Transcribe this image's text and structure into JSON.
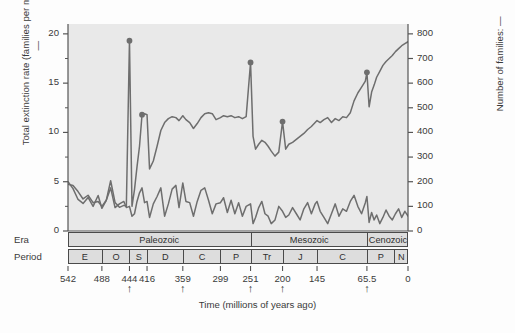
{
  "chart_data": {
    "type": "line",
    "title": "",
    "xlabel": "Time (millions of years ago)",
    "ylabel_left": "Total extinction rate (families per million years): —",
    "ylabel_right": "Number of families: —",
    "xlim": [
      542,
      0
    ],
    "x_reversed": true,
    "xticks": [
      "542",
      "488",
      "444",
      "416",
      "359",
      "299",
      "251",
      "200",
      "145",
      "65.5",
      "0"
    ],
    "xtick_values": [
      542,
      488,
      444,
      416,
      359,
      299,
      251,
      200,
      145,
      65.5,
      0
    ],
    "ylim_left": [
      0,
      21
    ],
    "yticks_left": [
      "0",
      "5",
      "10",
      "15",
      "20"
    ],
    "ytick_values_left": [
      0,
      5,
      10,
      15,
      20
    ],
    "ylim_right": [
      0,
      840
    ],
    "yticks_right": [
      "0",
      "100",
      "200",
      "300",
      "400",
      "500",
      "600",
      "700",
      "800"
    ],
    "ytick_values_right": [
      0,
      100,
      200,
      300,
      400,
      500,
      600,
      700,
      800
    ],
    "grid": false,
    "legend": "none",
    "mass_extinction_arrows": [
      444,
      359,
      251,
      200,
      65.5
    ],
    "series": [
      {
        "name": "Total extinction rate (families per million years)",
        "axis": "left",
        "color": "#6e6e6e",
        "x": [
          542,
          534,
          526,
          518,
          510,
          502,
          494,
          488,
          481,
          474,
          467,
          460,
          453,
          449,
          444,
          440,
          436,
          432,
          428,
          424,
          420,
          416,
          412,
          406,
          400,
          394,
          388,
          382,
          376,
          370,
          365,
          359,
          354,
          348,
          342,
          336,
          330,
          324,
          318,
          312,
          306,
          299,
          294,
          288,
          282,
          276,
          270,
          264,
          258,
          251,
          247,
          243,
          238,
          233,
          228,
          223,
          218,
          212,
          206,
          200,
          195,
          190,
          184,
          178,
          172,
          166,
          160,
          154,
          148,
          145,
          140,
          134,
          128,
          122,
          116,
          110,
          104,
          98,
          92,
          86,
          80,
          74,
          68,
          65.5,
          62,
          58,
          54,
          50,
          45,
          40,
          35,
          30,
          25,
          20,
          15,
          10,
          5,
          0
        ],
        "y": [
          5.0,
          4.3,
          3.2,
          2.8,
          3.4,
          2.5,
          3.6,
          2.3,
          3.1,
          5.1,
          2.9,
          2.4,
          2.6,
          2.5,
          19.3,
          2.5,
          4.2,
          6.5,
          8.6,
          11.8,
          11.9,
          11.8,
          6.3,
          7.1,
          8.6,
          10.2,
          11.0,
          11.4,
          11.6,
          11.5,
          11.2,
          11.7,
          11.3,
          11.0,
          10.4,
          10.9,
          11.5,
          11.9,
          12.0,
          11.9,
          11.3,
          11.5,
          11.7,
          11.6,
          11.7,
          11.5,
          11.6,
          11.4,
          11.6,
          17.1,
          9.6,
          8.3,
          8.8,
          9.2,
          9.0,
          8.6,
          8.1,
          7.6,
          8.0,
          11.1,
          8.3,
          8.8,
          9.0,
          9.3,
          9.6,
          9.9,
          10.3,
          10.6,
          11.0,
          11.2,
          11.0,
          11.3,
          11.5,
          11.0,
          11.4,
          11.2,
          11.6,
          11.5,
          12.0,
          13.2,
          14.0,
          14.6,
          15.2,
          16.1,
          12.6,
          14.1,
          14.8,
          15.6,
          16.2,
          16.8,
          17.2,
          17.5,
          17.8,
          18.2,
          18.5,
          18.8,
          19.0,
          19.2
        ],
        "markers": [
          {
            "x": 444,
            "y": 19.3
          },
          {
            "x": 424,
            "y": 11.8
          },
          {
            "x": 251,
            "y": 17.1
          },
          {
            "x": 200,
            "y": 11.1
          },
          {
            "x": 65.5,
            "y": 16.1
          }
        ]
      },
      {
        "name": "Number of families",
        "axis": "right",
        "color": "#6e6e6e",
        "x": [
          542,
          534,
          526,
          518,
          510,
          502,
          494,
          488,
          481,
          474,
          467,
          460,
          453,
          449,
          444,
          440,
          436,
          432,
          428,
          424,
          420,
          416,
          412,
          406,
          400,
          394,
          388,
          382,
          376,
          370,
          365,
          359,
          354,
          348,
          342,
          336,
          330,
          324,
          318,
          312,
          306,
          299,
          294,
          288,
          282,
          276,
          270,
          264,
          258,
          251,
          247,
          243,
          238,
          233,
          228,
          223,
          218,
          212,
          206,
          200,
          195,
          190,
          184,
          178,
          172,
          166,
          160,
          154,
          148,
          145,
          140,
          134,
          128,
          122,
          116,
          110,
          104,
          98,
          92,
          86,
          80,
          74,
          68,
          65.5,
          62,
          58,
          54,
          50,
          45,
          40,
          35,
          30,
          25,
          20,
          15,
          10,
          5,
          0
        ],
        "y": [
          190,
          185,
          160,
          130,
          145,
          115,
          120,
          100,
          125,
          175,
          95,
          110,
          120,
          95,
          100,
          60,
          70,
          120,
          155,
          175,
          115,
          120,
          55,
          110,
          140,
          175,
          60,
          110,
          170,
          185,
          95,
          195,
          120,
          115,
          60,
          120,
          165,
          175,
          125,
          70,
          110,
          115,
          135,
          75,
          125,
          70,
          115,
          60,
          100,
          110,
          30,
          55,
          95,
          120,
          70,
          60,
          30,
          45,
          100,
          80,
          55,
          65,
          95,
          70,
          45,
          90,
          115,
          70,
          110,
          120,
          80,
          55,
          30,
          70,
          110,
          60,
          90,
          80,
          120,
          145,
          100,
          70,
          115,
          140,
          35,
          75,
          45,
          65,
          30,
          55,
          85,
          60,
          45,
          70,
          90,
          55,
          80,
          60
        ]
      }
    ]
  },
  "strat": {
    "era_row_label": "Era",
    "period_row_label": "Period",
    "eras": [
      {
        "name": "Paleozoic",
        "start": 542,
        "end": 251
      },
      {
        "name": "Mesozoic",
        "start": 251,
        "end": 65.5
      },
      {
        "name": "Cenozoic",
        "start": 65.5,
        "end": 0
      }
    ],
    "periods": [
      {
        "name": "E",
        "start": 542,
        "end": 488
      },
      {
        "name": "O",
        "start": 488,
        "end": 444
      },
      {
        "name": "S",
        "start": 444,
        "end": 416
      },
      {
        "name": "D",
        "start": 416,
        "end": 359
      },
      {
        "name": "C",
        "start": 359,
        "end": 299
      },
      {
        "name": "P",
        "start": 299,
        "end": 251
      },
      {
        "name": "Tr",
        "start": 251,
        "end": 200
      },
      {
        "name": "J",
        "start": 200,
        "end": 145
      },
      {
        "name": "C",
        "start": 145,
        "end": 65.5
      },
      {
        "name": "P",
        "start": 65.5,
        "end": 23
      },
      {
        "name": "N",
        "start": 23,
        "end": 0
      }
    ]
  },
  "colors": {
    "plot_background": "#e9e9e9",
    "line": "#6e6e6e",
    "axis": "#555555",
    "band_fill": "#dddddd",
    "band_border": "#4a4a4a",
    "text": "#3a3a3a"
  }
}
